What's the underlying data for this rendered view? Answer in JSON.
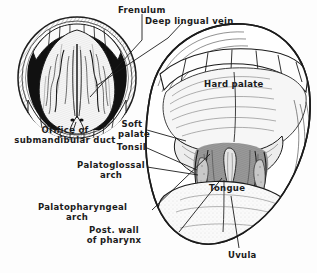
{
  "figure": {
    "type": "line-drawing",
    "background_color": "#fdfdfd",
    "ink_color": "#1b1b1b",
    "panels": [
      {
        "name": "underside-of-tongue",
        "position": "left",
        "description": "Open mouth with tongue raised showing its inferior surface, sublingual region and lower teeth"
      },
      {
        "name": "oropharynx-view",
        "position": "right",
        "description": "Wide open mouth showing hard palate, soft palate, uvula, tonsils, faucial arches and posterior pharyngeal wall"
      }
    ]
  },
  "labels": [
    {
      "id": "frenulum",
      "text": "Frenulum"
    },
    {
      "id": "deep-lingual-vein",
      "text": "Deep lingual vein"
    },
    {
      "id": "hard-palate",
      "text": "Hard palate"
    },
    {
      "id": "soft-palate",
      "text": "Soft\npalate"
    },
    {
      "id": "tonsil",
      "text": "Tonsil"
    },
    {
      "id": "orifice-of-submandibular-duct",
      "text": "Orifice of\nsubmandibular duct"
    },
    {
      "id": "palatoglossal-arch",
      "text": "Palatoglossal\narch"
    },
    {
      "id": "palatopharyngeal-arch",
      "text": "Palatopharyngeal\narch"
    },
    {
      "id": "post-wall-of-pharynx",
      "text": "Post. wall\nof pharynx"
    },
    {
      "id": "tongue",
      "text": "Tongue"
    },
    {
      "id": "uvula",
      "text": "Uvula"
    }
  ]
}
